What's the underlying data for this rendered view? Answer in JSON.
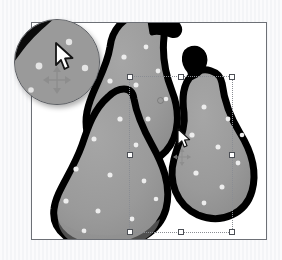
{
  "app": {
    "window_title": "",
    "background_color": "#f2f3f5"
  },
  "canvas": {
    "name": "image-canvas",
    "background_color": "#ffffff",
    "border_color": "#6d7076",
    "x": 31,
    "y": 22,
    "width": 236,
    "height": 218
  },
  "artwork": {
    "subject": "three pears",
    "fill_color": "#9a9a9a",
    "outline_color": "#000000",
    "speckle_color": "#e9e9e9",
    "shadow_color": "#8a8a8a",
    "pears": [
      {
        "name": "left-pear",
        "label": "Pear 1"
      },
      {
        "name": "top-pear",
        "label": "Pear 2"
      },
      {
        "name": "right-pear",
        "label": "Pear 3"
      }
    ]
  },
  "selection": {
    "name": "selection-bounding-box",
    "style": "dotted",
    "color": "#8a8d93",
    "x": 128,
    "y": 75,
    "width": 104,
    "height": 157,
    "handles": [
      {
        "name": "handle-nw",
        "position": "nw"
      },
      {
        "name": "handle-n",
        "position": "n"
      },
      {
        "name": "handle-ne",
        "position": "ne"
      },
      {
        "name": "handle-w",
        "position": "w"
      },
      {
        "name": "handle-e",
        "position": "e"
      },
      {
        "name": "handle-sw",
        "position": "sw"
      },
      {
        "name": "handle-s",
        "position": "s"
      },
      {
        "name": "handle-se",
        "position": "se"
      }
    ],
    "rotate_handle": {
      "name": "rotate-handle",
      "x": 128,
      "y": 77
    }
  },
  "cursors": {
    "pointer": {
      "name": "mouse-pointer-cursor",
      "icon": "arrow-cursor-icon",
      "x": 178,
      "y": 136
    },
    "move_marker": {
      "name": "move-crosshair-marker",
      "icon": "move-crosshair-icon",
      "x": 172,
      "y": 156
    }
  },
  "magnifier": {
    "name": "magnifier-loupe",
    "icon": "magnifier-icon",
    "x": 14,
    "y": 19,
    "diameter": 86,
    "zoom_level": "",
    "shows": "zoomed pear outline with arrow cursor and move crosshair",
    "cursor_icon": "arrow-cursor-icon",
    "crosshair_icon": "move-crosshair-icon"
  }
}
